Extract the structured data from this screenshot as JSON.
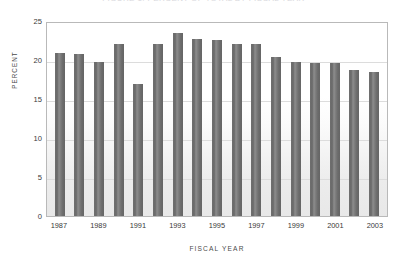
{
  "figure": {
    "cutoff_title": "FIGURE 1.  PERCENT OF TOTAL BY FISCAL YEAR"
  },
  "chart_data": {
    "type": "bar",
    "title": "",
    "xlabel": "Fiscal Year",
    "ylabel": "Percent",
    "ylim": [
      0,
      25
    ],
    "yticks": [
      25,
      20,
      15,
      10,
      5,
      0
    ],
    "grid": true,
    "legend": "none",
    "bar_color": "#6e6e6e",
    "categories": [
      "1987",
      "1988",
      "1989",
      "1990",
      "1991",
      "1992",
      "1993",
      "1994",
      "1995",
      "1996",
      "1997",
      "1998",
      "1999",
      "2000",
      "2001",
      "2002",
      "2003"
    ],
    "tick_labels": [
      "1987",
      "",
      "1989",
      "",
      "1991",
      "",
      "1993",
      "",
      "1995",
      "",
      "1997",
      "",
      "1999",
      "",
      "2001",
      "",
      "2003"
    ],
    "values": [
      20.9,
      20.8,
      19.7,
      22.0,
      16.9,
      22.0,
      23.4,
      22.7,
      22.6,
      22.1,
      22.1,
      20.4,
      19.8,
      19.6,
      19.6,
      18.7,
      18.4
    ]
  }
}
